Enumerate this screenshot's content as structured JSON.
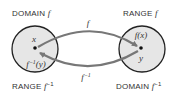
{
  "diagram": {
    "left_set": {
      "top_label": "DOMAIN",
      "top_label_fn": "f",
      "bottom_label": "RANGE",
      "bottom_label_fn": "f",
      "bottom_label_sup": "−1",
      "point_label_top": "x",
      "point_label_bottom_fn": "f",
      "point_label_bottom_sup": "−1",
      "point_label_bottom_arg": "(y)"
    },
    "right_set": {
      "top_label": "RANGE",
      "top_label_fn": "f",
      "bottom_label": "DOMAIN",
      "bottom_label_fn": "f",
      "bottom_label_sup": "−1",
      "point_label_top": "f(x)",
      "point_label_bottom": "y"
    },
    "forward_arrow": {
      "label": "f"
    },
    "inverse_arrow": {
      "label": "f",
      "label_sup": "−1"
    },
    "colors": {
      "circle_fill": "#e6e6e6",
      "circle_stroke": "#222222",
      "arrow": "#777777",
      "text": "#333333"
    }
  }
}
